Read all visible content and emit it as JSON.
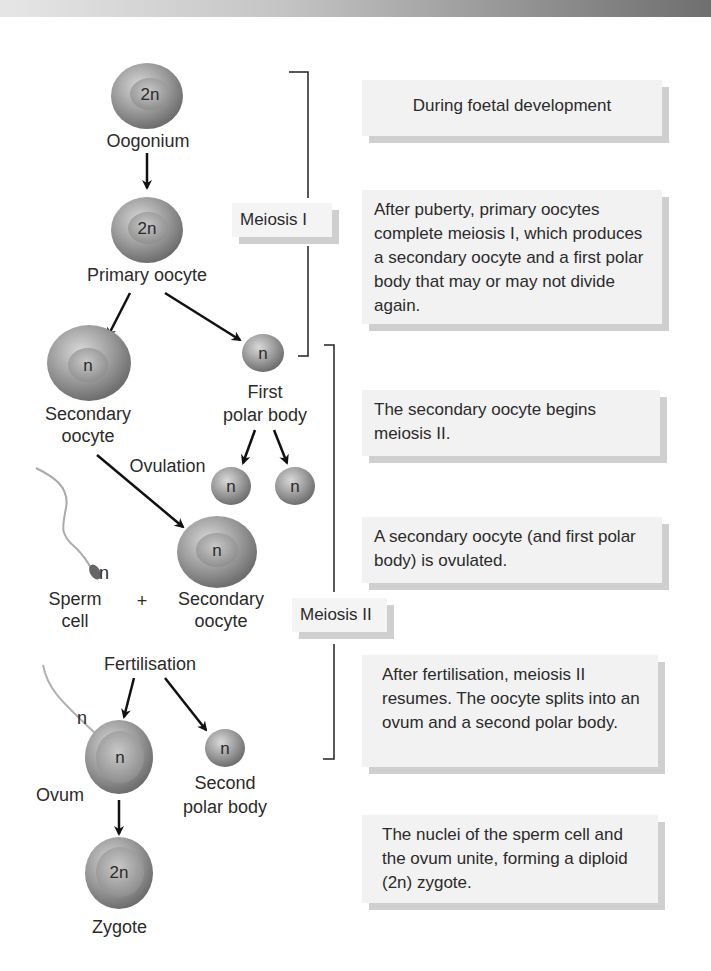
{
  "diagram": {
    "type": "flowchart",
    "stages": [
      {
        "id": "oogonium",
        "label": "Oogonium",
        "ploidy": "2n"
      },
      {
        "id": "primary_oocyte",
        "label": "Primary oocyte",
        "ploidy": "2n"
      },
      {
        "id": "secondary_oocyte",
        "label": "Secondary oocyte",
        "ploidy": "n"
      },
      {
        "id": "first_polar_body",
        "label": "First polar body",
        "ploidy": "n"
      },
      {
        "id": "polar_body_division_a",
        "label": "",
        "ploidy": "n"
      },
      {
        "id": "polar_body_division_b",
        "label": "",
        "ploidy": "n"
      },
      {
        "id": "secondary_oocyte_ovulated",
        "label": "Secondary oocyte",
        "ploidy": "n"
      },
      {
        "id": "sperm_cell",
        "label": "Sperm cell",
        "ploidy": "n"
      },
      {
        "id": "ovum",
        "label": "Ovum",
        "ploidy": "n"
      },
      {
        "id": "second_polar_body",
        "label": "Second polar body",
        "ploidy": "n"
      },
      {
        "id": "zygote",
        "label": "Zygote",
        "ploidy": "2n"
      }
    ],
    "edges": [
      {
        "from": "oogonium",
        "to": "primary_oocyte"
      },
      {
        "from": "primary_oocyte",
        "to": "secondary_oocyte"
      },
      {
        "from": "primary_oocyte",
        "to": "first_polar_body"
      },
      {
        "from": "first_polar_body",
        "to": "polar_body_division_a"
      },
      {
        "from": "first_polar_body",
        "to": "polar_body_division_b"
      },
      {
        "from": "secondary_oocyte",
        "to": "secondary_oocyte_ovulated",
        "label": "Ovulation"
      },
      {
        "from": "fertilisation",
        "to": "ovum"
      },
      {
        "from": "fertilisation",
        "to": "second_polar_body"
      },
      {
        "from": "ovum",
        "to": "zygote"
      }
    ]
  },
  "labels": {
    "oogonium": "Oogonium",
    "primary_oocyte": "Primary oocyte",
    "secondary_oocyte_line1": "Secondary",
    "secondary_oocyte_line2": "oocyte",
    "first_polar_line1": "First",
    "first_polar_line2": "polar body",
    "ovulation": "Ovulation",
    "sperm_line1": "Sperm",
    "sperm_line2": "cell",
    "plus": "+",
    "sec_oocyte2_line1": "Secondary",
    "sec_oocyte2_line2": "oocyte",
    "fertilisation": "Fertilisation",
    "ovum": "Ovum",
    "second_polar_line1": "Second",
    "second_polar_line2": "polar body",
    "zygote": "Zygote",
    "sperm_n": "n",
    "ovum_sperm_n": "n"
  },
  "ploidy": {
    "oogonium": "2n",
    "primary": "2n",
    "secondary": "n",
    "first_polar": "n",
    "polar_a": "n",
    "polar_b": "n",
    "secondary2": "n",
    "ovum": "n",
    "second_polar": "n",
    "zygote": "2n"
  },
  "phases": {
    "meiosis1": "Meiosis I",
    "meiosis2": "Meiosis II"
  },
  "notes": [
    "During foetal development",
    "After puberty, primary oocytes complete meiosis I, which produces a secondary oocyte and a first polar body that may or may not divide again.",
    "The secondary oocyte begins meiosis II.",
    "A secondary oocyte (and first polar body) is ovulated.",
    "After fertilisation, meiosis II resumes. The oocyte splits into an ovum and a second polar body.",
    "The nuclei of the sperm cell and the ovum unite, forming a diploid (2n) zygote."
  ],
  "colors": {
    "cell_outer": "#8c8c8c",
    "cell_inner": "#b8b8b8",
    "note_bg": "#f2f2f2",
    "note_shadow": "#cfcfcf"
  }
}
